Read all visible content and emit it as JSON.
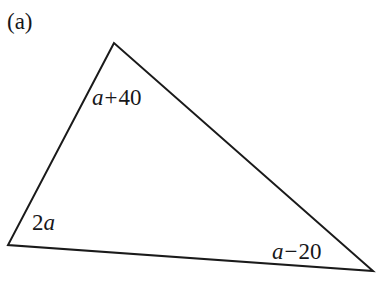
{
  "figure": {
    "part_label": "(a)",
    "shape": "triangle",
    "stroke_color": "#1a1a1a",
    "background_color": "#ffffff",
    "stroke_width": 2,
    "vertices": [
      {
        "name": "apex",
        "x": 114,
        "y": 43
      },
      {
        "name": "bottom-left",
        "x": 8,
        "y": 245
      },
      {
        "name": "bottom-right",
        "x": 373,
        "y": 271
      }
    ],
    "angle_labels": [
      {
        "id": "apex",
        "at_vertex": "apex",
        "text": "a + 40",
        "variable": "a",
        "operator": "+",
        "constant": "40",
        "x": 92,
        "y": 86
      },
      {
        "id": "left",
        "at_vertex": "bottom-left",
        "text": "2a",
        "coefficient": "2",
        "variable": "a",
        "operator": "",
        "constant": "",
        "x": 32,
        "y": 211
      },
      {
        "id": "right",
        "at_vertex": "bottom-right",
        "text": "a − 20",
        "variable": "a",
        "operator": "−",
        "constant": "20",
        "x": 272,
        "y": 240
      }
    ]
  }
}
